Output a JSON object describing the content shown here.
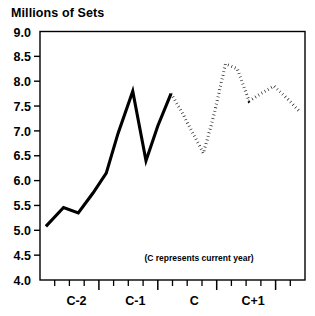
{
  "chart_data": {
    "type": "line",
    "title": "Millions of Sets",
    "xlabel": "",
    "ylabel": "",
    "ylim": [
      4.0,
      9.0
    ],
    "ytick_labels": [
      "9.0",
      "8.5",
      "8.0",
      "7.5",
      "7.0",
      "6.5",
      "6.0",
      "5.5",
      "5.0",
      "4.5",
      "4.0"
    ],
    "ytick_values": [
      9.0,
      8.5,
      8.0,
      7.5,
      7.0,
      6.5,
      6.0,
      5.5,
      5.0,
      4.5,
      4.0
    ],
    "xtick_labels": [
      "C-2",
      "C-1",
      "C",
      "C+1"
    ],
    "xtick_values": [
      3,
      7,
      11,
      15
    ],
    "x_minor_count": 18,
    "grid": false,
    "legend": "none",
    "annotation": "(C represents current year)",
    "series": [
      {
        "name": "Actual",
        "style": "solid",
        "x": [
          0.4,
          1.6,
          2.6,
          3.6,
          4.5,
          5.3,
          6.3,
          7.2,
          8.0,
          8.9
        ],
        "values": [
          5.08,
          5.46,
          5.35,
          5.75,
          6.15,
          6.95,
          7.8,
          6.4,
          7.1,
          7.75
        ]
      },
      {
        "name": "Forecast",
        "style": "dotted",
        "x": [
          8.9,
          9.6,
          10.3,
          11.1,
          11.8,
          12.6,
          13.4,
          14.2,
          15.0,
          15.9,
          16.8,
          17.6
        ],
        "values": [
          7.75,
          7.4,
          7.0,
          6.55,
          7.3,
          8.35,
          8.25,
          7.6,
          7.75,
          7.9,
          7.65,
          7.4
        ]
      }
    ]
  }
}
